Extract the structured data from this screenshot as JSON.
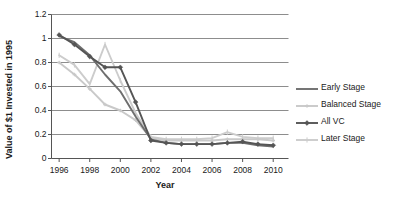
{
  "chart_data": {
    "type": "line",
    "title": "",
    "xlabel": "Year",
    "ylabel": "Value of $1 Invested in 1995",
    "xlim": [
      1995.5,
      2011.0
    ],
    "ylim": [
      0,
      1.2
    ],
    "grid": true,
    "grid_axis": "y",
    "legend_position": "right",
    "x": [
      1996,
      1997,
      1998,
      1999,
      2000,
      2001,
      2002,
      2003,
      2004,
      2005,
      2006,
      2007,
      2008,
      2009,
      2010
    ],
    "xticks": [
      1996,
      1998,
      2000,
      2002,
      2004,
      2006,
      2008,
      2010
    ],
    "xtick_labels": [
      "1996",
      "1998",
      "2000",
      "2002",
      "2004",
      "2006",
      "2008",
      "2010"
    ],
    "yticks": [
      0,
      0.2,
      0.4,
      0.6,
      0.8,
      1.0,
      1.2
    ],
    "ytick_labels": [
      "0",
      "0.2",
      "0.4",
      "0.6",
      "0.8",
      "1",
      "1.2"
    ],
    "series": [
      {
        "name": "Early Stage",
        "color": "#6e6e6e",
        "marker": "none",
        "values": [
          1.02,
          0.97,
          0.86,
          0.7,
          0.56,
          0.35,
          0.16,
          0.13,
          0.12,
          0.12,
          0.12,
          0.13,
          0.13,
          0.11,
          0.1
        ]
      },
      {
        "name": "Balanced Stage",
        "color": "#c9c9c9",
        "marker": "dash",
        "values": [
          0.8,
          0.7,
          0.58,
          0.45,
          0.4,
          0.32,
          0.17,
          0.15,
          0.15,
          0.15,
          0.15,
          0.16,
          0.16,
          0.16,
          0.15
        ]
      },
      {
        "name": "All VC",
        "color": "#555555",
        "marker": "diamond",
        "values": [
          1.03,
          0.95,
          0.85,
          0.76,
          0.76,
          0.47,
          0.15,
          0.13,
          0.12,
          0.12,
          0.12,
          0.13,
          0.14,
          0.12,
          0.11
        ]
      },
      {
        "name": "Later Stage",
        "color": "#cccccc",
        "marker": "plus",
        "values": [
          0.86,
          0.78,
          0.62,
          0.95,
          0.65,
          0.38,
          0.18,
          0.16,
          0.16,
          0.16,
          0.17,
          0.22,
          0.18,
          0.17,
          0.17
        ]
      }
    ]
  },
  "axes": {
    "y_title": "Value of $1 Invested in 1995",
    "x_title": "Year"
  },
  "legend": {
    "items": [
      {
        "label": "Early Stage"
      },
      {
        "label": "Balanced Stage"
      },
      {
        "label": "All VC"
      },
      {
        "label": "Later Stage"
      }
    ]
  },
  "colors": {
    "axis": "#555555",
    "grid": "#808080",
    "text": "#1a1a1a",
    "background": "#ffffff"
  }
}
